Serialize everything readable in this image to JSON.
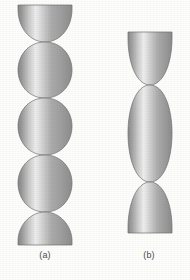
{
  "figure": {
    "background_color": "#fdfdfc",
    "caption_color": "#4a4a4a",
    "shading": {
      "style": "metallic-cylindrical-gradient",
      "edge_left_color": "#8f8f8f",
      "highlight_color": "#ededed",
      "mid_color": "#a6a6a6",
      "edge_right_color": "#9a9a9a",
      "outline_color": "#6e6e6e",
      "highlight_position_percent": 33
    },
    "panels": [
      {
        "id": "panel-a",
        "caption": "(a)",
        "description": "vertical chain of five lens-shaped lobes meeting at four pinch points",
        "lobe_count": 5,
        "pinch_count": 4,
        "center_x": 45,
        "max_half_width": 27,
        "top_y": 5,
        "bottom_y": 245,
        "pinch_y": [
          42,
          98,
          155,
          212
        ],
        "top_end": "flat",
        "bottom_end": "flat"
      },
      {
        "id": "panel-b",
        "caption": "(b)",
        "description": "vertical chain of three lobes meeting at two pinch points, wider and taller lobes",
        "lobe_count": 3,
        "pinch_count": 2,
        "center_x": 150,
        "max_half_width": 22,
        "top_y": 32,
        "bottom_y": 233,
        "pinch_y": [
          85,
          182
        ],
        "top_end": "flat",
        "bottom_end": "flat"
      }
    ]
  }
}
